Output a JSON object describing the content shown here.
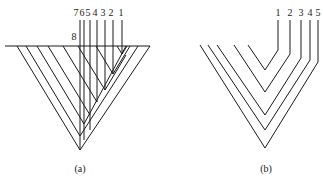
{
  "figure_a": {
    "caption": "(a)",
    "top_labels": [
      "7",
      "6",
      "5",
      "4",
      "3",
      "2",
      "1"
    ],
    "side_label": "8"
  },
  "figure_b": {
    "caption": "(b)",
    "top_labels": [
      "1",
      "2",
      "3",
      "4",
      "5"
    ]
  },
  "colors": {
    "line": "#1a1a1a",
    "background": "#ffffff"
  }
}
